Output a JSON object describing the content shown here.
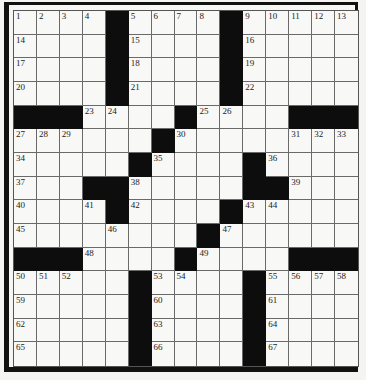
{
  "puzzle": {
    "size": [
      15,
      15
    ],
    "colors": {
      "black": "#0d0d0d",
      "white": "#f8f8f6",
      "line": "#6a6a6a"
    },
    "rows": [
      [
        "1",
        "2",
        "3",
        "4",
        "#",
        "5",
        "6",
        "7",
        "8",
        "#",
        "9",
        "10",
        "11",
        "12",
        "13"
      ],
      [
        "14",
        "",
        "",
        "",
        "#",
        "15",
        "",
        "",
        "",
        "#",
        "16",
        "",
        "",
        "",
        ""
      ],
      [
        "17",
        "",
        "",
        "",
        "#",
        "18",
        "",
        "",
        "",
        "#",
        "19",
        "",
        "",
        "",
        ""
      ],
      [
        "20",
        "",
        "",
        "",
        "#",
        "21",
        "",
        "",
        "",
        "#",
        "22",
        "",
        "",
        "",
        ""
      ],
      [
        "#",
        "#",
        "#",
        "23",
        "24",
        "",
        "",
        "#",
        "25",
        "26",
        "",
        "",
        "#",
        "#",
        "#"
      ],
      [
        "27",
        "28",
        "29",
        "",
        "",
        "",
        "#",
        "30",
        "",
        "",
        "",
        "",
        "31",
        "32",
        "33"
      ],
      [
        "34",
        "",
        "",
        "",
        "",
        "#",
        "35",
        "",
        "",
        "",
        "#",
        "36",
        "",
        "",
        ""
      ],
      [
        "37",
        "",
        "",
        "#",
        "#",
        "38",
        "",
        "",
        "",
        "",
        "#",
        "#",
        "39",
        "",
        ""
      ],
      [
        "40",
        "",
        "",
        "41",
        "#",
        "42",
        "",
        "",
        "",
        "#",
        "43",
        "44",
        "",
        "",
        ""
      ],
      [
        "45",
        "",
        "",
        "",
        "46",
        "",
        "",
        "",
        "#",
        "47",
        "",
        "",
        "",
        "",
        ""
      ],
      [
        "#",
        "#",
        "#",
        "48",
        "",
        "",
        "",
        "#",
        "49",
        "",
        "",
        "",
        "#",
        "#",
        "#"
      ],
      [
        "50",
        "51",
        "52",
        "",
        "",
        "#",
        "53",
        "54",
        "",
        "",
        "#",
        "55",
        "56",
        "57",
        "58"
      ],
      [
        "59",
        "",
        "",
        "",
        "",
        "#",
        "60",
        "",
        "",
        "",
        "#",
        "61",
        "",
        "",
        ""
      ],
      [
        "62",
        "",
        "",
        "",
        "",
        "#",
        "63",
        "",
        "",
        "",
        "#",
        "64",
        "",
        "",
        ""
      ],
      [
        "65",
        "",
        "",
        "",
        "",
        "#",
        "66",
        "",
        "",
        "",
        "#",
        "67",
        "",
        "",
        ""
      ]
    ]
  }
}
